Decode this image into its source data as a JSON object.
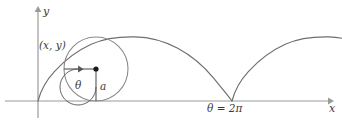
{
  "figure": {
    "background_color": "#ffffff",
    "width": 342,
    "height": 127
  },
  "axes": {
    "x_label": "x",
    "y_label": "y",
    "axis_color": "#9a9a9a",
    "origin": {
      "x": 38,
      "y": 101
    },
    "x_axis_end": {
      "x": 330,
      "y": 101
    },
    "y_axis_top": {
      "x": 38,
      "y": 8
    }
  },
  "curve": {
    "name": "cycloid",
    "color": "#6f6f6f",
    "arches": 2,
    "cusp_label": "θ = 2π",
    "cusp_position": {
      "x": 232,
      "y": 101
    },
    "peak_height_px": 64,
    "arch_width_px": 194
  },
  "circle": {
    "label_radius": "a",
    "label_angle": "θ",
    "color": "#8a8a8a",
    "center": {
      "x": 96,
      "y": 69
    },
    "radius_px": 32,
    "center_dot_color": "#1a1a1a"
  },
  "point": {
    "label": "(x, y)",
    "position": {
      "x": 64,
      "y": 69
    }
  },
  "colors": {
    "axis": "#9a9a9a",
    "curve": "#6f6f6f",
    "circle": "#8a8a8a",
    "radius_line": "#555555",
    "text": "#3a3a3a"
  }
}
